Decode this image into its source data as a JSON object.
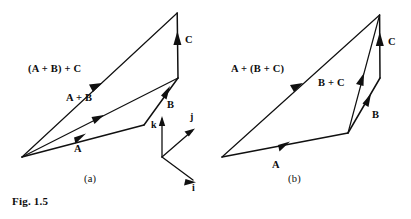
{
  "figure": {
    "caption": "Fig. 1.5",
    "background_color": "#ffffff",
    "ink_color": "#101010"
  },
  "panels": [
    {
      "tag": "(a)",
      "expression": "(A + B) + C",
      "vectors": [
        {
          "name": "A",
          "label": "A"
        },
        {
          "name": "B",
          "label": "B"
        },
        {
          "name": "C",
          "label": "C"
        },
        {
          "name": "A+B",
          "label": "A + B"
        },
        {
          "name": "(A+B)+C",
          "label": "(A + B) + C"
        }
      ],
      "axes": {
        "i": "i",
        "j": "j",
        "k": "k"
      }
    },
    {
      "tag": "(b)",
      "expression": "A + (B + C)",
      "vectors": [
        {
          "name": "A",
          "label": "A"
        },
        {
          "name": "B",
          "label": "B"
        },
        {
          "name": "C",
          "label": "C"
        },
        {
          "name": "B+C",
          "label": "B + C"
        },
        {
          "name": "A+(B+C)",
          "label": "A + (B + C)"
        }
      ]
    }
  ],
  "labels": {
    "a_sum_outer": "(A + B) + C",
    "a_sum_inner": "A + B",
    "a_vec_a": "A",
    "a_vec_b": "B",
    "a_vec_c": "C",
    "a_axis_i": "i",
    "a_axis_j": "j",
    "a_axis_k": "k",
    "a_tag": "(a)",
    "b_sum_outer": "A + (B + C)",
    "b_sum_inner": "B + C",
    "b_vec_a": "A",
    "b_vec_b": "B",
    "b_vec_c": "C",
    "b_tag": "(b)",
    "fig_caption": "Fig. 1.5"
  }
}
